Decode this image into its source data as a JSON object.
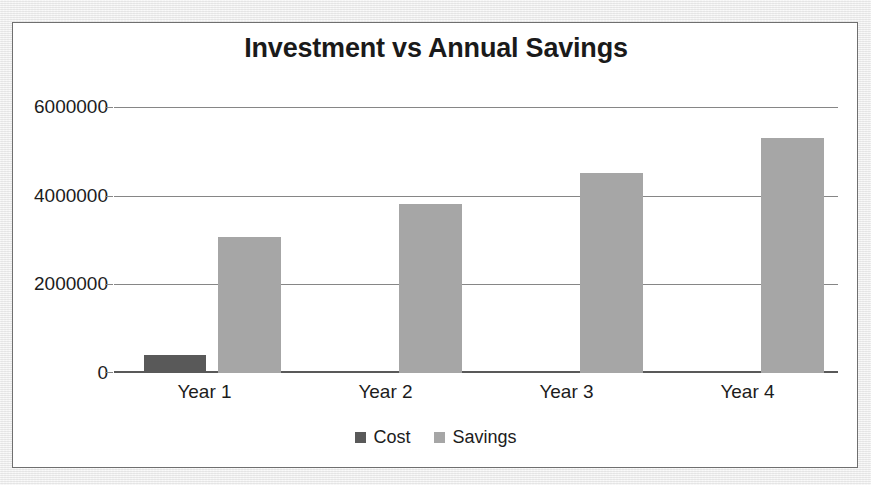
{
  "chart_data": {
    "type": "bar",
    "title": "Investment vs Annual Savings",
    "xlabel": "",
    "ylabel": "",
    "categories": [
      "Year 1",
      "Year 2",
      "Year 3",
      "Year 4"
    ],
    "series": [
      {
        "name": "Cost",
        "color": "#595959",
        "values": [
          400000,
          0,
          0,
          0
        ]
      },
      {
        "name": "Savings",
        "color": "#a6a6a6",
        "values": [
          3100000,
          3840000,
          4540000,
          5340000
        ]
      }
    ],
    "ylim": [
      0,
      6000000
    ],
    "ytick_labels": [
      "0",
      "2000000",
      "4000000",
      "6000000"
    ],
    "ytick_values": [
      0,
      2000000,
      4000000,
      6000000
    ],
    "grid": true,
    "legend_position": "bottom"
  },
  "frame": {
    "border_color": "#6f6f6f",
    "background": "#ffffff"
  }
}
